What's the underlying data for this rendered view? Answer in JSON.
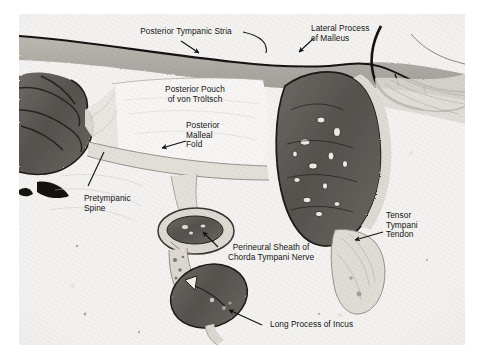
{
  "figure": {
    "kind": "histology-photomicrograph",
    "region": "middle ear / tympanic cavity section",
    "background_color": "#ffffff",
    "plate_color": "#f2f1ef",
    "tissue_dark_color": "#54514e",
    "tissue_mid_color": "#8d8a86",
    "tissue_light_color": "#dedbd6",
    "label_color": "#141414"
  },
  "labels": [
    {
      "id": "posterior-tympanic-stria",
      "text": "Posterior Tympanic Stria",
      "align": "center"
    },
    {
      "id": "lateral-process-of-malleus",
      "text": "Lateral Process\nof Malleus",
      "align": "left"
    },
    {
      "id": "posterior-pouch-of-von-troltsch",
      "text": "Posterior Pouch\nof von Tröltsch",
      "align": "center"
    },
    {
      "id": "posterior-malleal-fold",
      "text": "Posterior\nMalleal\nFold",
      "align": "left"
    },
    {
      "id": "pretympanic-spine",
      "text": "Pretympanic\nSpine",
      "align": "left"
    },
    {
      "id": "perineural-sheath-of-chorda-tympani-nerve",
      "text": "Perineural Sheath of\nChorda Tympani Nerve",
      "align": "center"
    },
    {
      "id": "tensor-tympani-tendon",
      "text": "Tensor\nTympani\nTendon",
      "align": "left"
    },
    {
      "id": "long-process-of-incus",
      "text": "Long Process of Incus",
      "align": "left"
    }
  ]
}
